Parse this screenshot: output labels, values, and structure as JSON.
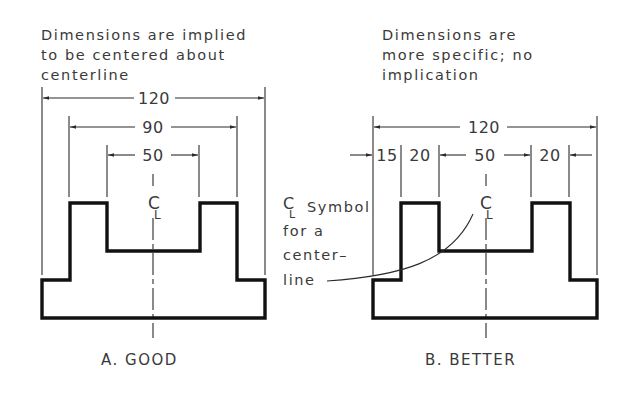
{
  "figure_a": {
    "caption_lines": [
      "Dimensions are implied",
      "to be centered about",
      "centerline"
    ],
    "dimensions": [
      "120",
      "90",
      "50"
    ],
    "centerline_symbol": "C",
    "centerline_symbol_sub": "L",
    "label": "A.  GOOD"
  },
  "figure_b": {
    "caption_lines": [
      "Dimensions are",
      "more specific; no",
      "implication"
    ],
    "dimensions": {
      "overall": "120",
      "chain": [
        "15",
        "20",
        "50",
        "20"
      ]
    },
    "centerline_symbol": "C",
    "centerline_symbol_sub": "L",
    "label": "B.  BETTER"
  },
  "annotation": {
    "symbol": "C",
    "symbol_sub": "L",
    "lines": [
      "Symbol",
      "for a",
      "center–",
      "line"
    ]
  }
}
